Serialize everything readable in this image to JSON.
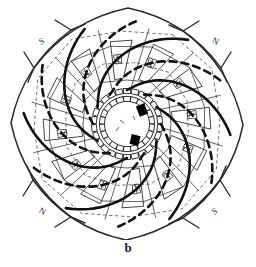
{
  "figure": {
    "caption": "b",
    "background_color": "#ffffff",
    "ink_color": "#111111",
    "line_color_thin": "#3a3a3a",
    "marker_color": "#000000"
  },
  "cardinals": [
    {
      "id": "top-left",
      "label": "S",
      "x": 42,
      "y": 42,
      "rotation": -28
    },
    {
      "id": "top-right",
      "label": "N",
      "x": 215,
      "y": 42,
      "rotation": 28
    },
    {
      "id": "bottom-left",
      "label": "N",
      "x": 42,
      "y": 212,
      "rotation": 28
    },
    {
      "id": "bottom-right",
      "label": "S",
      "x": 215,
      "y": 212,
      "rotation": -28
    }
  ],
  "plan": {
    "center": {
      "x": 127,
      "y": 124
    },
    "arms": 12,
    "arm_styles": [
      "solid",
      "dashed"
    ],
    "arm_stroke_width": 2.6,
    "arm_inner_radius": 34,
    "arm_outer_radius": 104,
    "arm_sweep_degrees": 96,
    "ring_count": 4,
    "ring_radii": [
      44,
      60,
      76,
      92
    ],
    "ring_sides": 12,
    "ring_rotation_step": 9,
    "cells": 12,
    "cell_inner_radius": 46,
    "cell_outer_radius": 84,
    "core": {
      "outer_ring_radius": 33,
      "inner_ring_radius": 25,
      "outer_block_count": 26,
      "inner_block_count": 22,
      "block_length": 7,
      "block_width": 5
    },
    "markers": [
      {
        "id": "marker-upper",
        "x": 142,
        "y": 110,
        "w": 9,
        "h": 11,
        "rotation": -22
      },
      {
        "id": "marker-lower",
        "x": 135,
        "y": 140,
        "w": 9,
        "h": 10,
        "rotation": 14
      }
    ],
    "brackets": [
      {
        "id": "bracket-top-left",
        "rotation": 0
      },
      {
        "id": "bracket-top-right",
        "rotation": 90
      },
      {
        "id": "bracket-bottom-right",
        "rotation": 180
      },
      {
        "id": "bracket-bottom-left",
        "rotation": 270
      }
    ]
  },
  "chart_data": {
    "type": "diagram",
    "title": "b",
    "symmetry_order": 12,
    "cardinal_labels": [
      "S",
      "N",
      "N",
      "S"
    ],
    "legend": []
  }
}
